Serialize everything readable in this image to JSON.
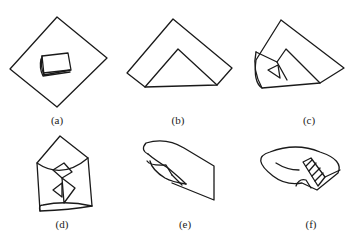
{
  "figure": {
    "panels": [
      {
        "id": "a",
        "label": "(a)",
        "description": "object placed on diagonal square sheet"
      },
      {
        "id": "b",
        "label": "(b)",
        "description": "bottom corner folded up"
      },
      {
        "id": "c",
        "label": "(c)",
        "description": "left side folded over"
      },
      {
        "id": "d",
        "label": "(d)",
        "description": "both sides folded in, envelope shape"
      },
      {
        "id": "e",
        "label": "(e)",
        "description": "rolled and top flap folded"
      },
      {
        "id": "f",
        "label": "(f)",
        "description": "finished wrapped package with hatched fold"
      }
    ]
  },
  "colors": {
    "stroke": "#1a1a1a",
    "background": "#ffffff"
  }
}
